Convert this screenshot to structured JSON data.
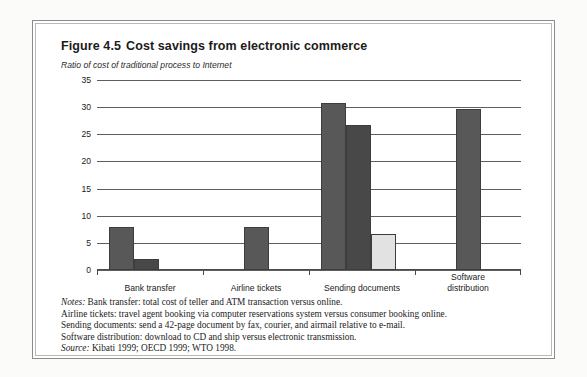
{
  "figure": {
    "number": "Figure 4.5",
    "title": "Cost savings from electronic commerce",
    "subtitle": "Ratio of cost of traditional process to Internet"
  },
  "notes": {
    "lead_label": "Notes:",
    "line1_rest": " Bank transfer: total cost of teller and ATM transaction versus online.",
    "line2": "Airline tickets: travel agent booking via computer reservations system versus consumer booking online.",
    "line3": "Sending documents: send a 42-page document by fax, courier, and airmail relative to e-mail.",
    "line4": "Software distribution: download to CD and ship versus electronic transmission.",
    "source_label": "Source:",
    "source_rest": " Kibati 1999; OECD 1999; WTO 1998."
  },
  "colors": {
    "bar_dark": "#585858",
    "bar_darker": "#484848",
    "bar_light": "#e2e2e2",
    "gridline": "#5e5e5e",
    "axis": "#4a4a4a",
    "frame": "#8c8c8c",
    "page_bg": "#fbfbfa"
  },
  "chart_data": {
    "type": "bar",
    "subtitle": "Ratio of cost of traditional process to Internet",
    "xlabel": "",
    "ylabel": "Ratio of cost of traditional process to Internet",
    "ylim": [
      0,
      35
    ],
    "yticks": [
      0,
      5,
      10,
      15,
      20,
      25,
      30,
      35
    ],
    "ytick_labels": [
      "0",
      "5",
      "10",
      "15",
      "20",
      "25",
      "30",
      "35"
    ],
    "grid": true,
    "legend": "none",
    "categories": [
      "Bank transfer",
      "Airline tickets",
      "Sending documents",
      "Software\ndistribution"
    ],
    "groups": [
      {
        "category": "Bank transfer",
        "bars": [
          {
            "value": 8.0,
            "color": "#585858"
          },
          {
            "value": 2.0,
            "color": "#484848"
          }
        ]
      },
      {
        "category": "Airline tickets",
        "bars": [
          {
            "value": 8.0,
            "color": "#585858"
          }
        ]
      },
      {
        "category": "Sending documents",
        "bars": [
          {
            "value": 30.8,
            "color": "#585858"
          },
          {
            "value": 26.7,
            "color": "#484848"
          },
          {
            "value": 6.7,
            "color": "#e2e2e2"
          }
        ]
      },
      {
        "category": "Software distribution",
        "bars": [
          {
            "value": 29.7,
            "color": "#585858"
          }
        ]
      }
    ]
  }
}
